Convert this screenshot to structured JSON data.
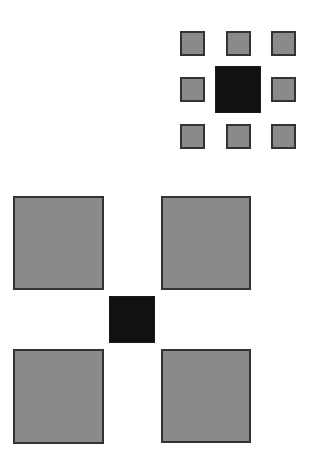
{
  "figure": {
    "colors": {
      "surround_fill": "#8a8a8a",
      "surround_border": "#333333",
      "center_fill": "#111111",
      "background": "#ffffff"
    },
    "top_group": {
      "center": {
        "x": 215,
        "y": 66,
        "w": 46,
        "h": 47
      },
      "surrounds": [
        {
          "x": 180,
          "y": 31,
          "w": 25,
          "h": 25
        },
        {
          "x": 226,
          "y": 31,
          "w": 25,
          "h": 25
        },
        {
          "x": 271,
          "y": 31,
          "w": 25,
          "h": 25
        },
        {
          "x": 180,
          "y": 77,
          "w": 25,
          "h": 25
        },
        {
          "x": 271,
          "y": 77,
          "w": 25,
          "h": 25
        },
        {
          "x": 180,
          "y": 124,
          "w": 25,
          "h": 25
        },
        {
          "x": 226,
          "y": 124,
          "w": 25,
          "h": 25
        },
        {
          "x": 271,
          "y": 124,
          "w": 25,
          "h": 25
        }
      ]
    },
    "bottom_group": {
      "center": {
        "x": 109,
        "y": 296,
        "w": 46,
        "h": 47
      },
      "surrounds": [
        {
          "x": 13,
          "y": 196,
          "w": 91,
          "h": 94
        },
        {
          "x": 161,
          "y": 196,
          "w": 90,
          "h": 94
        },
        {
          "x": 13,
          "y": 349,
          "w": 91,
          "h": 95
        },
        {
          "x": 161,
          "y": 349,
          "w": 90,
          "h": 94
        }
      ]
    }
  }
}
